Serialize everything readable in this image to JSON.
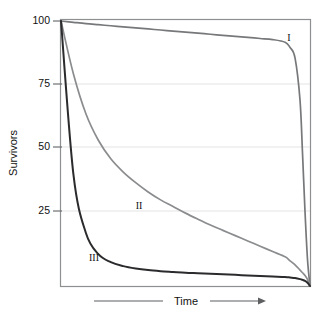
{
  "chart_data": {
    "type": "line",
    "title": "",
    "subtitle": "",
    "xlabel": "Time",
    "ylabel": "Survivors",
    "grid": true,
    "legend_position": "inline-annotations",
    "xlim": [
      0,
      100
    ],
    "ylim": [
      0,
      100
    ],
    "x_tick_labels": [],
    "y_ticks": [
      25,
      50,
      75,
      100
    ],
    "y_tick_labels": [
      "25",
      "50",
      "75",
      "100"
    ],
    "x": [
      0,
      5,
      10,
      15,
      20,
      25,
      30,
      35,
      40,
      45,
      50,
      55,
      60,
      65,
      70,
      75,
      80,
      85,
      90,
      92,
      94,
      96,
      97,
      98,
      99,
      100
    ],
    "series": [
      {
        "name": "I",
        "label": "I",
        "color": "#77787a",
        "description": "Type I survivorship: high survival through early and middle life, steep decline late in life",
        "values": [
          100,
          99.5,
          99,
          98.6,
          98.2,
          97.8,
          97.4,
          97,
          96.6,
          96.2,
          95.8,
          95.4,
          95,
          94.6,
          94.2,
          93.8,
          93.4,
          93,
          92,
          90,
          86,
          70,
          50,
          28,
          10,
          0
        ],
        "label_point": {
          "x": 93,
          "y": 88
        }
      },
      {
        "name": "II",
        "label": "II",
        "color": "#8a8c8e",
        "description": "Type II survivorship: constant rate of mortality, roughly exponential decline",
        "values": [
          100,
          80,
          65,
          55,
          48,
          43,
          39,
          35.5,
          32.5,
          30,
          27.5,
          25.2,
          23,
          21,
          19,
          17,
          15,
          13,
          11,
          9.5,
          8,
          6,
          5,
          4,
          2.5,
          0
        ],
        "label_point": {
          "x": 31,
          "y": 32
        }
      },
      {
        "name": "III",
        "label": "III",
        "color": "#2b2b2d",
        "description": "Type III survivorship: very high early mortality, survivors live long",
        "values": [
          100,
          42,
          20,
          12,
          9,
          7.5,
          6.6,
          6,
          5.6,
          5.3,
          5,
          4.8,
          4.6,
          4.4,
          4.2,
          4,
          3.8,
          3.6,
          3.4,
          3.2,
          3,
          2.6,
          2.3,
          1.9,
          1.2,
          0
        ],
        "label_point": {
          "x": 13,
          "y": 11
        }
      }
    ],
    "annotations": [
      {
        "text": "I",
        "x": 93,
        "y": 88
      },
      {
        "text": "II",
        "x": 31,
        "y": 32
      },
      {
        "text": "III",
        "x": 13,
        "y": 11
      }
    ]
  },
  "axes": {
    "y_label": "Survivors",
    "y_tick_100": "100",
    "y_tick_75": "75",
    "y_tick_50": "50",
    "y_tick_25": "25",
    "x_label": "Time"
  },
  "curve_labels": {
    "type_one": "I",
    "type_two": "II",
    "type_three": "III"
  },
  "colors": {
    "curve_one": "#77787a",
    "curve_two": "#8a8c8e",
    "curve_three": "#2b2b2d",
    "frame": "#8d8f91",
    "grid": "#e2e2e2",
    "text": "#111111",
    "background": "#ffffff"
  }
}
